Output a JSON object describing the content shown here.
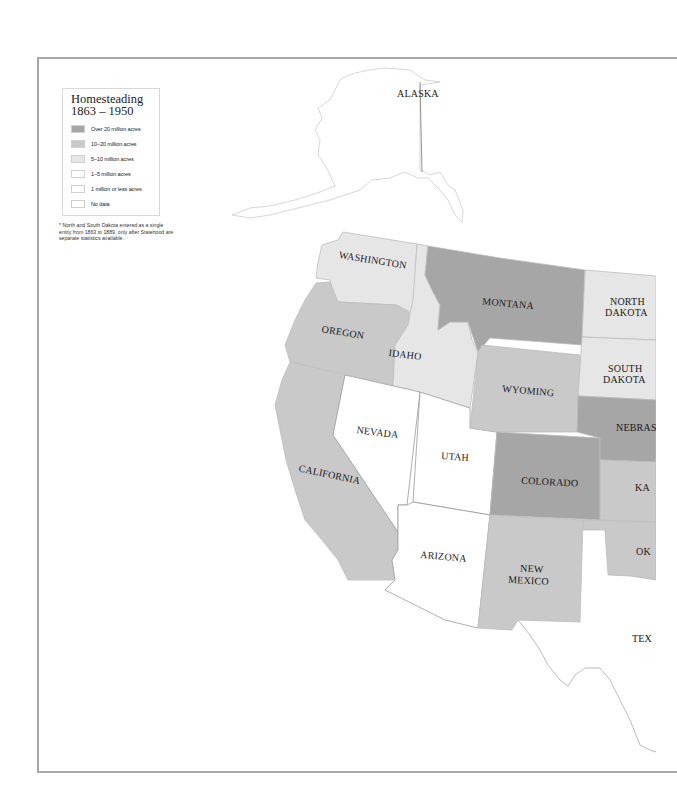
{
  "legend": {
    "title_line1": "Homesteading",
    "title_line2": "1863 – 1950",
    "items": [
      {
        "label": "Over 20 million acres",
        "color": "#a6a6a6"
      },
      {
        "label": "10–20 million acres",
        "color": "#c9c9c9"
      },
      {
        "label": "5–10 million acres",
        "color": "#e6e6e6"
      },
      {
        "label": "1–5 million acres",
        "color": "#ffffff"
      },
      {
        "label": "1 million or less acres",
        "color": "#ffffff"
      },
      {
        "label": "No data",
        "color": "#ffffff"
      }
    ],
    "footnote": "* North and South Dakota entered as a single entity from 1863 to 1889, only after Statehood are separate statistics available."
  },
  "states": {
    "alaska": "ALASKA",
    "washington": "WASHINGTON",
    "oregon": "OREGON",
    "california": "CALIFORNIA",
    "idaho": "IDAHO",
    "nevada": "NEVADA",
    "utah": "UTAH",
    "arizona": "ARIZONA",
    "montana": "MONTANA",
    "wyoming": "WYOMING",
    "colorado": "COLORADO",
    "new_mexico_1": "NEW",
    "new_mexico_2": "MEXICO",
    "north_dakota_1": "NORTH",
    "north_dakota_2": "DAKOTA",
    "south_dakota_1": "SOUTH",
    "south_dakota_2": "DAKOTA",
    "nebraska": "NEBRAS",
    "kansas": "KA",
    "oklahoma": "OK",
    "texas": "TEX"
  },
  "colors": {
    "over20": "#a6a6a6",
    "10to20": "#c9c9c9",
    "5to10": "#e6e6e6",
    "low": "#ffffff",
    "border": "#9a9a9a"
  }
}
